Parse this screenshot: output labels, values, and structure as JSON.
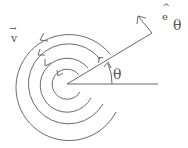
{
  "diagram": {
    "colors": {
      "stroke": "#666666",
      "text": "#555555",
      "background": "#ffffff"
    },
    "center": {
      "x": 67,
      "y": 84
    },
    "circles": [
      {
        "r": 15,
        "arrow": true
      },
      {
        "r": 27,
        "arrow": true
      },
      {
        "r": 40,
        "arrow": true
      },
      {
        "r": 53,
        "arrow": false
      }
    ],
    "radial_line": {
      "to": {
        "x": 152,
        "y": 33
      }
    },
    "horizontal_line": {
      "to": {
        "x": 158,
        "y": 84
      }
    },
    "labels": {
      "velocity": "v",
      "velocity_arrow": "→",
      "radius": "r",
      "angle": "θ",
      "unit_vector_base": "e",
      "unit_vector_hat": "^",
      "unit_vector_subscript": "θ"
    }
  }
}
